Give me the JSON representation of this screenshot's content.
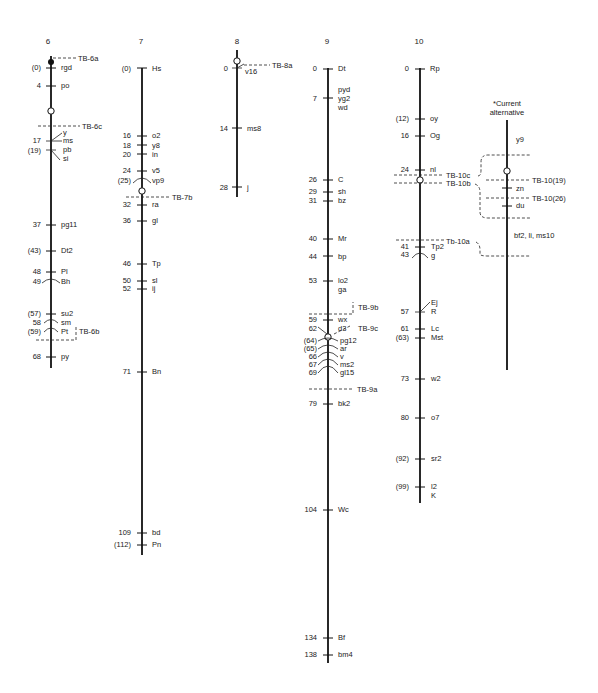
{
  "figure": {
    "type": "genetic-linkage-map",
    "chromosomes": [
      {
        "id": "6",
        "label": "6",
        "loci": [
          {
            "pos": "(0)",
            "gene": "rgd"
          },
          {
            "pos": "4",
            "gene": "po"
          },
          {
            "pos": "17",
            "gene": "y"
          },
          {
            "pos": "",
            "gene": "ms"
          },
          {
            "pos": "(19)",
            "gene": "pb"
          },
          {
            "pos": "",
            "gene": "si"
          },
          {
            "pos": "37",
            "gene": "pg11"
          },
          {
            "pos": "(43)",
            "gene": "Dt2"
          },
          {
            "pos": "48",
            "gene": "Pl"
          },
          {
            "pos": "49",
            "gene": "Bh"
          },
          {
            "pos": "(57)",
            "gene": "su2"
          },
          {
            "pos": "58",
            "gene": "sm"
          },
          {
            "pos": "(59)",
            "gene": "Pt"
          },
          {
            "pos": "68",
            "gene": "py"
          }
        ],
        "breakpoints": [
          "TB-6a",
          "TB-6c",
          "TB-6b"
        ]
      },
      {
        "id": "7",
        "label": "7",
        "loci": [
          {
            "pos": "(0)",
            "gene": "Hs"
          },
          {
            "pos": "16",
            "gene": "o2"
          },
          {
            "pos": "18",
            "gene": "y8"
          },
          {
            "pos": "20",
            "gene": "in"
          },
          {
            "pos": "24",
            "gene": "v5"
          },
          {
            "pos": "(25)",
            "gene": "vp9"
          },
          {
            "pos": "32",
            "gene": "ra"
          },
          {
            "pos": "36",
            "gene": "gl"
          },
          {
            "pos": "46",
            "gene": "Tp"
          },
          {
            "pos": "50",
            "gene": "sl"
          },
          {
            "pos": "52",
            "gene": "ij"
          },
          {
            "pos": "71",
            "gene": "Bn"
          },
          {
            "pos": "109",
            "gene": "bd"
          },
          {
            "pos": "(112)",
            "gene": "Pn"
          }
        ],
        "breakpoints": [
          "TB-7b"
        ]
      },
      {
        "id": "8",
        "label": "8",
        "loci": [
          {
            "pos": "0",
            "gene": "v16"
          },
          {
            "pos": "14",
            "gene": "ms8"
          },
          {
            "pos": "28",
            "gene": "j"
          }
        ],
        "breakpoints": [
          "TB-8a"
        ]
      },
      {
        "id": "9",
        "label": "9",
        "loci": [
          {
            "pos": "0",
            "gene": "Dt"
          },
          {
            "pos": "",
            "gene": "pyd"
          },
          {
            "pos": "7",
            "gene": "yg2"
          },
          {
            "pos": "",
            "gene": "wd"
          },
          {
            "pos": "26",
            "gene": "C"
          },
          {
            "pos": "29",
            "gene": "sh"
          },
          {
            "pos": "31",
            "gene": "bz"
          },
          {
            "pos": "40",
            "gene": "Mr"
          },
          {
            "pos": "44",
            "gene": "bp"
          },
          {
            "pos": "53",
            "gene": "lo2"
          },
          {
            "pos": "",
            "gene": "ga"
          },
          {
            "pos": "59",
            "gene": "wx"
          },
          {
            "pos": "62",
            "gene": "d3"
          },
          {
            "pos": "(64)",
            "gene": "pg12"
          },
          {
            "pos": "(65)",
            "gene": "ar"
          },
          {
            "pos": "66",
            "gene": "v"
          },
          {
            "pos": "67",
            "gene": "ms2"
          },
          {
            "pos": "69",
            "gene": "gl15"
          },
          {
            "pos": "79",
            "gene": "bk2"
          },
          {
            "pos": "104",
            "gene": "Wc"
          },
          {
            "pos": "134",
            "gene": "Bf"
          },
          {
            "pos": "138",
            "gene": "bm4"
          }
        ],
        "breakpoints": [
          "TB-9b",
          "TB-9c",
          "TB-9a"
        ]
      },
      {
        "id": "10",
        "label": "10",
        "loci": [
          {
            "pos": "0",
            "gene": "Rp"
          },
          {
            "pos": "(12)",
            "gene": "oy"
          },
          {
            "pos": "16",
            "gene": "Og"
          },
          {
            "pos": "24",
            "gene": "nl"
          },
          {
            "pos": "41",
            "gene": "Tp2"
          },
          {
            "pos": "43",
            "gene": "g"
          },
          {
            "pos": "",
            "gene": "Ej"
          },
          {
            "pos": "57",
            "gene": "R"
          },
          {
            "pos": "61",
            "gene": "Lc"
          },
          {
            "pos": "(63)",
            "gene": "Mst"
          },
          {
            "pos": "73",
            "gene": "w2"
          },
          {
            "pos": "80",
            "gene": "o7"
          },
          {
            "pos": "(92)",
            "gene": "sr2"
          },
          {
            "pos": "(99)",
            "gene": "l2"
          },
          {
            "pos": "",
            "gene": "K"
          }
        ],
        "breakpoints": [
          "TB-10c",
          "TB-10b",
          "Tb-10a"
        ]
      }
    ],
    "alternative": {
      "title_line1": "*Current",
      "title_line2": "alternative",
      "genes": [
        "y9",
        "zn",
        "du",
        "bf2, li, ms10"
      ],
      "breakpoints": [
        "TB-10(19)",
        "TB-10(26)"
      ]
    }
  },
  "text": {
    "c6": "6",
    "c7": "7",
    "c8": "8",
    "c9": "9",
    "c10": "10",
    "alt1": "*Current",
    "alt2": "alternative",
    "tb6a": "TB-6a",
    "tb6c": "TB-6c",
    "tb6b": "TB-6b",
    "tb7b": "TB-7b",
    "tb8a": "TB-8a",
    "tb9b": "TB-9b",
    "tb9c": "TB-9c",
    "tb9a": "TB-9a",
    "tb10c": "TB-10c",
    "tb10b": "TB-10b",
    "tb10a": "Tb-10a",
    "tb10_19": "TB-10(19)",
    "tb10_26": "TB-10(26)",
    "c6p": [
      "(0)",
      "4",
      "17",
      "(19)",
      "37",
      "(43)",
      "48",
      "49",
      "(57)",
      "58",
      "(59)",
      "68"
    ],
    "c6g": [
      "rgd",
      "po",
      "y",
      "ms",
      "pb",
      "si",
      "pg11",
      "Dt2",
      "Pl",
      "Bh",
      "su2",
      "sm",
      "Pt",
      "py"
    ],
    "c7p": [
      "(0)",
      "16",
      "18",
      "20",
      "24",
      "(25)",
      "32",
      "36",
      "46",
      "50",
      "52",
      "71",
      "109",
      "(112)"
    ],
    "c7g": [
      "Hs",
      "o2",
      "y8",
      "in",
      "v5",
      "vp9",
      "ra",
      "gl",
      "Tp",
      "sl",
      "ij",
      "Bn",
      "bd",
      "Pn"
    ],
    "c8p": [
      "0",
      "14",
      "28"
    ],
    "c8g": [
      "v16",
      "ms8",
      "j"
    ],
    "c9p": [
      "0",
      "7",
      "26",
      "29",
      "31",
      "40",
      "44",
      "53",
      "59",
      "62",
      "(64)",
      "(65)",
      "66",
      "67",
      "69",
      "79",
      "104",
      "134",
      "138"
    ],
    "c9g": [
      "Dt",
      "pyd",
      "yg2",
      "wd",
      "C",
      "sh",
      "bz",
      "Mr",
      "bp",
      "lo2",
      "ga",
      "wx",
      "d3",
      "pg12",
      "ar",
      "v",
      "ms2",
      "gl15",
      "bk2",
      "Wc",
      "Bf",
      "bm4"
    ],
    "c10p": [
      "0",
      "(12)",
      "16",
      "24",
      "41",
      "43",
      "57",
      "61",
      "(63)",
      "73",
      "80",
      "(92)",
      "(99)"
    ],
    "c10g": [
      "Rp",
      "oy",
      "Og",
      "nl",
      "Tp2",
      "g",
      "Ej",
      "R",
      "Lc",
      "Mst",
      "w2",
      "o7",
      "sr2",
      "l2",
      "K"
    ],
    "altg": [
      "y9",
      "zn",
      "du",
      "bf2, li, ms10"
    ]
  }
}
